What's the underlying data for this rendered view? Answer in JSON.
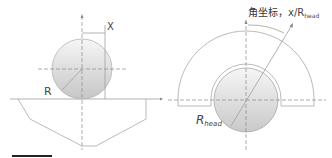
{
  "left_figure": {
    "label_x": "X",
    "label_r": "R"
  },
  "right_figure": {
    "angle_label_cn": "角坐标，",
    "angle_label_var": "x/R",
    "angle_label_sub": "head",
    "radius_label": "R",
    "radius_label_sub": "head"
  },
  "colors": {
    "line": "#9a9a9a",
    "dash": "#8a8a8a",
    "ball_light": "#f4f4f4",
    "ball_dark": "#c8c8c8",
    "legend_bar": "#222222"
  }
}
